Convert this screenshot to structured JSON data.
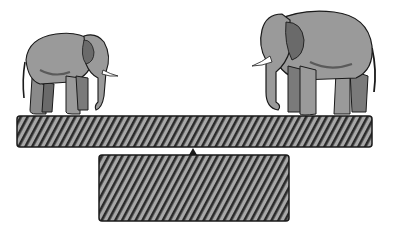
{
  "figure": {
    "elements": {
      "left_elephant": {
        "label": "small elephant",
        "facing": "right"
      },
      "right_elephant": {
        "label": "large elephant",
        "facing": "left"
      },
      "plank": {
        "pattern": "diagonal hatch"
      },
      "fulcrum": {
        "shape": "small triangle"
      },
      "base": {
        "pattern": "diagonal hatch"
      }
    },
    "colors": {
      "elephant_fill": "#9a9a9a",
      "elephant_shadow": "#5a5a5a",
      "outline": "#1a1a1a",
      "hatch_dark": "#2a2a2a",
      "hatch_light": "#a8a8a8",
      "tusk": "#ffffff",
      "background": "#ffffff"
    }
  }
}
